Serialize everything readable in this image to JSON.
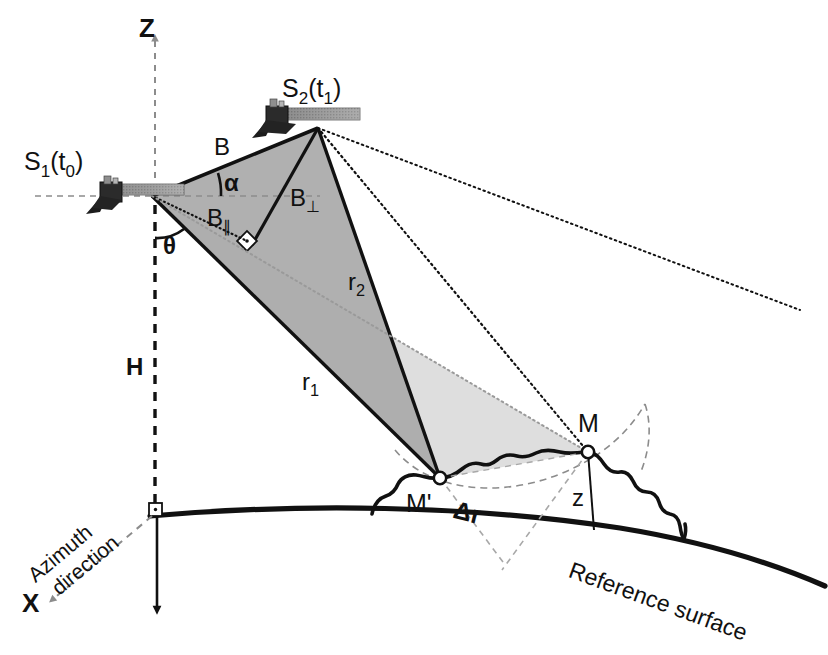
{
  "figure": {
    "background_color": "#ffffff",
    "ink_color": "#111111",
    "gray_guide_color": "#8c8c8c",
    "beam_dark_fill": "#a8a8a8",
    "beam_light_fill": "#dcdcdc",
    "panel_gray": "#9a9a9a"
  },
  "axes": {
    "z_axis_label": "Z",
    "x_axis_label": "X",
    "height_label": "H",
    "azimuth_label_line1": "Azimuth",
    "azimuth_label_line2": "direction"
  },
  "satellites": [
    {
      "id": "s1",
      "label_main": "S",
      "label_sub": "1",
      "label_arg_open": "(t",
      "label_arg_sub": "0",
      "label_arg_close": ")",
      "label_text": "S1(t0)",
      "x": 152,
      "y": 196
    },
    {
      "id": "s2",
      "label_main": "S",
      "label_sub": "2",
      "label_arg_open": "(t",
      "label_arg_sub": "1",
      "label_arg_close": ")",
      "label_text": "S2(t1)",
      "x": 318,
      "y": 128
    }
  ],
  "baselines": {
    "b_label": "B",
    "b_perp_main": "B",
    "b_perp_sub": "⊥",
    "b_perp_text": "B⊥",
    "b_para_main": "B",
    "b_para_sub": "∥",
    "b_para_text": "B∥"
  },
  "angles": {
    "alpha_label": "α",
    "theta_label": "θ"
  },
  "ranges": {
    "r1_main": "r",
    "r1_sub": "1",
    "r1_text": "r1",
    "r2_main": "r",
    "r2_sub": "2",
    "r2_text": "r2",
    "delta_r_label": "Δr"
  },
  "ground": {
    "point_m_label": "M",
    "point_m_prime_label": "M'",
    "height_z_label": "z",
    "reference_surface_label": "Reference surface"
  },
  "points": {
    "m": {
      "x": 588,
      "y": 452
    },
    "m_prime": {
      "x": 440,
      "y": 478
    },
    "origin_foot": {
      "x": 155,
      "y": 512
    }
  }
}
